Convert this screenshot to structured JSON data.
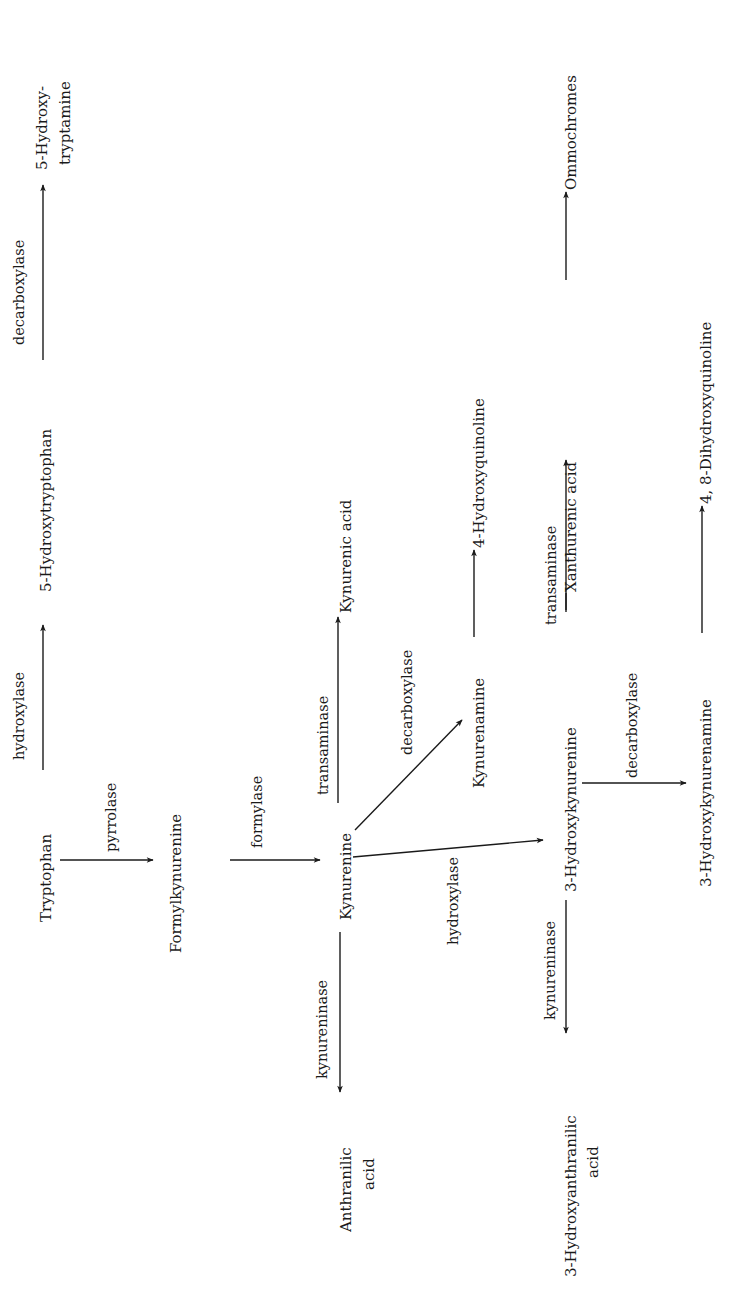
{
  "diagram": {
    "orientation": "rotated-90-ccw",
    "nodes": {
      "tryptophan": "Tryptophan",
      "hydroxytryptophan": "5-Hydroxytryptophan",
      "hydroxytryptamine_1": "5-Hydroxy-",
      "hydroxytryptamine_2": "tryptamine",
      "formylkynurenine": "Formylkynurenine",
      "kynurenine": "Kynurenine",
      "kynurenic_acid": "Kynurenic acid",
      "anthranilic_acid_1": "Anthranilic",
      "anthranilic_acid_2": "acid",
      "kynurenamine": "Kynurenamine",
      "hydroxyquinoline": "4-Hydroxyquinoline",
      "hydroxykynurenine": "3-Hydroxykynurenine",
      "xanthurenic_acid": "Xanthurenic acid",
      "ommochromes": "Ommochromes",
      "hydroxyanthranilic_acid_1": "3-Hydroxyanthranilic",
      "hydroxyanthranilic_acid_2": "acid",
      "hydroxykynurenamine": "3-Hydroxykynurenamine",
      "dihydroxyquinoline": "4, 8-Dihydroxyquinoline"
    },
    "enzymes": {
      "trp_hydroxylase": "hydroxylase",
      "htp_decarboxylase": "decarboxylase",
      "pyrrolase": "pyrrolase",
      "formylase": "formylase",
      "kyn_transaminase": "transaminase",
      "kyn_kynureninase": "kynureninase",
      "kyn_decarboxylase": "decarboxylase",
      "kyn_hydroxylase": "hydroxylase",
      "hk_transaminase": "transaminase",
      "hk_kynureninase": "kynureninase",
      "hk_decarboxylase": "decarboxylase"
    },
    "edges": [
      {
        "from": "Tryptophan",
        "to": "5-Hydroxytryptophan",
        "enzyme": "hydroxylase"
      },
      {
        "from": "5-Hydroxytryptophan",
        "to": "5-Hydroxytryptamine",
        "enzyme": "decarboxylase"
      },
      {
        "from": "Tryptophan",
        "to": "Formylkynurenine",
        "enzyme": "pyrrolase"
      },
      {
        "from": "Formylkynurenine",
        "to": "Kynurenine",
        "enzyme": "formylase"
      },
      {
        "from": "Kynurenine",
        "to": "Kynurenic acid",
        "enzyme": "transaminase"
      },
      {
        "from": "Kynurenine",
        "to": "Anthranilic acid",
        "enzyme": "kynureninase"
      },
      {
        "from": "Kynurenine",
        "to": "Kynurenamine",
        "enzyme": "decarboxylase"
      },
      {
        "from": "Kynurenamine",
        "to": "4-Hydroxyquinoline",
        "enzyme": ""
      },
      {
        "from": "Kynurenine",
        "to": "3-Hydroxykynurenine",
        "enzyme": "hydroxylase"
      },
      {
        "from": "3-Hydroxykynurenine",
        "to": "Xanthurenic acid",
        "enzyme": "transaminase"
      },
      {
        "from": "Xanthurenic acid",
        "to": "Ommochromes",
        "enzyme": ""
      },
      {
        "from": "3-Hydroxykynurenine",
        "to": "3-Hydroxyanthranilic acid",
        "enzyme": "kynureninase"
      },
      {
        "from": "3-Hydroxykynurenine",
        "to": "3-Hydroxykynurenamine",
        "enzyme": "decarboxylase"
      },
      {
        "from": "3-Hydroxykynurenamine",
        "to": "4, 8-Dihydroxyquinoline",
        "enzyme": ""
      }
    ]
  }
}
